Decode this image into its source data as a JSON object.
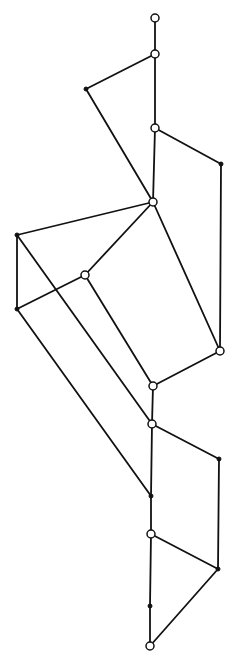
{
  "diagram": {
    "type": "lattice-graph",
    "nodes": [
      {
        "id": "n1",
        "x": 155,
        "y": 18,
        "kind": "open"
      },
      {
        "id": "n2",
        "x": 155,
        "y": 54,
        "kind": "open"
      },
      {
        "id": "n3",
        "x": 86,
        "y": 89,
        "kind": "filled"
      },
      {
        "id": "n4",
        "x": 155,
        "y": 128,
        "kind": "open"
      },
      {
        "id": "n5",
        "x": 221,
        "y": 164,
        "kind": "filled"
      },
      {
        "id": "n6",
        "x": 153,
        "y": 202,
        "kind": "open"
      },
      {
        "id": "n7",
        "x": 17,
        "y": 235,
        "kind": "filled"
      },
      {
        "id": "n8",
        "x": 85,
        "y": 275,
        "kind": "open"
      },
      {
        "id": "n9",
        "x": 17,
        "y": 309,
        "kind": "filled"
      },
      {
        "id": "n10",
        "x": 220,
        "y": 351,
        "kind": "open"
      },
      {
        "id": "n11",
        "x": 153,
        "y": 386,
        "kind": "open"
      },
      {
        "id": "n12",
        "x": 152,
        "y": 424,
        "kind": "open"
      },
      {
        "id": "n13",
        "x": 219,
        "y": 459,
        "kind": "filled"
      },
      {
        "id": "n14",
        "x": 151,
        "y": 496,
        "kind": "filled"
      },
      {
        "id": "n15",
        "x": 151,
        "y": 534,
        "kind": "open"
      },
      {
        "id": "n16",
        "x": 218,
        "y": 569,
        "kind": "filled"
      },
      {
        "id": "n17",
        "x": 150,
        "y": 606,
        "kind": "filled"
      },
      {
        "id": "n18",
        "x": 150,
        "y": 646,
        "kind": "open"
      }
    ],
    "edges": [
      [
        "n1",
        "n2"
      ],
      [
        "n2",
        "n3"
      ],
      [
        "n2",
        "n4"
      ],
      [
        "n3",
        "n6"
      ],
      [
        "n4",
        "n6"
      ],
      [
        "n4",
        "n5"
      ],
      [
        "n5",
        "n10"
      ],
      [
        "n6",
        "n7"
      ],
      [
        "n6",
        "n8"
      ],
      [
        "n6",
        "n10"
      ],
      [
        "n7",
        "n9"
      ],
      [
        "n8",
        "n9"
      ],
      [
        "n7",
        "n12"
      ],
      [
        "n8",
        "n11"
      ],
      [
        "n9",
        "n14"
      ],
      [
        "n10",
        "n11"
      ],
      [
        "n11",
        "n12"
      ],
      [
        "n12",
        "n13"
      ],
      [
        "n12",
        "n14"
      ],
      [
        "n13",
        "n16"
      ],
      [
        "n14",
        "n15"
      ],
      [
        "n15",
        "n16"
      ],
      [
        "n15",
        "n17"
      ],
      [
        "n17",
        "n18"
      ],
      [
        "n16",
        "n18"
      ]
    ]
  }
}
